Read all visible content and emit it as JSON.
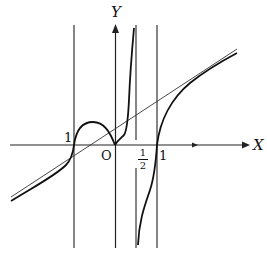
{
  "diagram": {
    "type": "function-graph",
    "axes": {
      "x_label": "X",
      "y_label": "Y",
      "origin_label": "O"
    },
    "tick_labels": {
      "neg_one": "1",
      "half_num": "1",
      "half_den": "2",
      "one": "1"
    },
    "vertical_asymptotes": [
      "x = -1",
      "x = 0",
      "x = 1/2",
      "x = 1"
    ],
    "oblique_asymptote": "slant line through the graph",
    "colors": {
      "ink": "#111111",
      "background": "#ffffff"
    }
  }
}
